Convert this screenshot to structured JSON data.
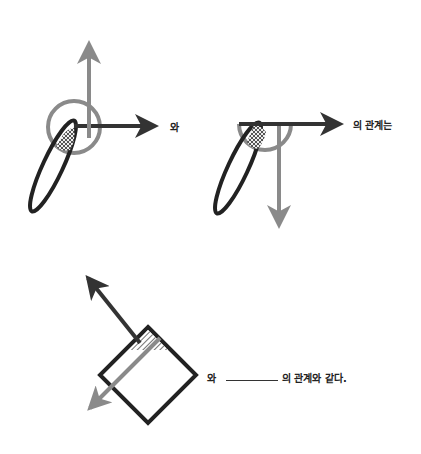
{
  "diagram1": {
    "suffix": "와"
  },
  "diagram2": {
    "suffix": "의 관계는"
  },
  "diagram3": {
    "prefix": "와",
    "blank": "",
    "suffix": "의 관계와 같다."
  },
  "colors": {
    "dark": "#333333",
    "gray": "#8a8a8a",
    "outline": "#222222"
  }
}
